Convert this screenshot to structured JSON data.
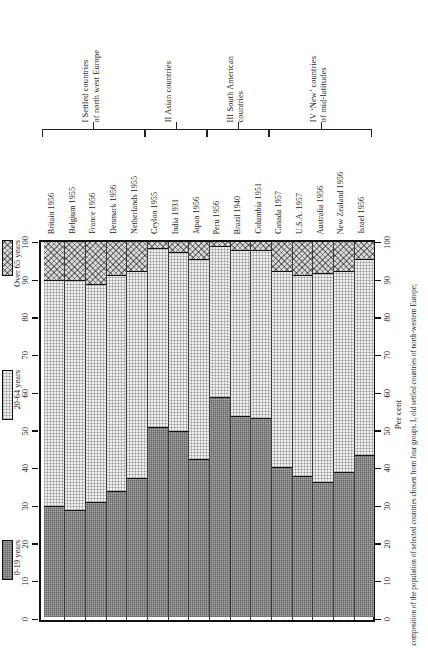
{
  "figure": {
    "caption": "Fig. 25.6  The age–composition of the population of selected countries chosen from four groups. I, old settled countries of north-western Europe;",
    "axis_title_right": "Per cent"
  },
  "legend": {
    "items": [
      {
        "key": "old",
        "label": "Over 65 years",
        "pattern": "cross-hatch"
      },
      {
        "key": "adult",
        "label": "20-64 years",
        "pattern": "fine-stipple"
      },
      {
        "key": "young",
        "label": "0-19 years",
        "pattern": "dark-stipple"
      }
    ]
  },
  "groups": [
    {
      "id": "I",
      "label": "I Settled countries\nof north west Europe",
      "line1": "I Settled countries",
      "line2": "of north west Europe",
      "count": 5
    },
    {
      "id": "II",
      "label": "II Asian countries",
      "line1": "II Asian countries",
      "line2": "",
      "count": 3
    },
    {
      "id": "III",
      "label": "III South American\ncountries",
      "line1": "III South American",
      "line2": "countries",
      "count": 3
    },
    {
      "id": "IV",
      "label": "IV 'New' countries\nof mid-latitudes",
      "line1": "IV ‘New’ countries",
      "line2": "of mid-latitudes",
      "count": 5
    }
  ],
  "axis": {
    "ticks": [
      0,
      10,
      20,
      30,
      40,
      50,
      60,
      70,
      80,
      90,
      100
    ],
    "tick_labels": [
      "0",
      "10",
      "20",
      "30",
      "40",
      "50",
      "60",
      "70",
      "80",
      "90",
      "100"
    ],
    "min": 0,
    "max": 100
  },
  "chart_data": {
    "type": "bar",
    "stacked": true,
    "title": "",
    "xlabel": "",
    "ylabel": "Per cent",
    "ylim": [
      0,
      100
    ],
    "grid": false,
    "legend_position": "left",
    "categories": [
      "Britain 1956",
      "Belgium 1955",
      "France 1956",
      "Denmark 1956",
      "Netherlands 1955",
      "Ceylon 1955",
      "India 1931",
      "Japan 1956",
      "Peru 1956",
      "Brazil 1940",
      "Columbia 1951",
      "Canada 1957",
      "U.S.A. 1957",
      "Australia 1956",
      "New Zealand 1956",
      "Israel 1956"
    ],
    "group_of_category": [
      "I",
      "I",
      "I",
      "I",
      "I",
      "II",
      "II",
      "II",
      "III",
      "III",
      "III",
      "IV",
      "IV",
      "IV",
      "IV"
    ],
    "series": [
      {
        "name": "0-19 years",
        "key": "young",
        "values": [
          29.5,
          28.5,
          30.5,
          33.5,
          37.0,
          50.5,
          49.5,
          42.0,
          58.5,
          53.5,
          53.0,
          40.0,
          37.5,
          36.0,
          38.5,
          43.0
        ]
      },
      {
        "name": "20-64 years",
        "key": "adult",
        "values": [
          60.0,
          61.0,
          58.0,
          57.5,
          55.0,
          47.5,
          47.5,
          53.0,
          40.0,
          44.0,
          44.5,
          52.0,
          53.5,
          55.5,
          53.5,
          52.0
        ]
      },
      {
        "name": "Over 65 years",
        "key": "old",
        "values": [
          10.5,
          10.5,
          11.5,
          9.0,
          8.0,
          2.0,
          3.0,
          5.0,
          1.5,
          2.5,
          2.5,
          8.0,
          9.0,
          8.5,
          8.0,
          5.0
        ]
      }
    ],
    "cumulative_tops": {
      "young": [
        29.5,
        28.5,
        30.5,
        33.5,
        37.0,
        50.5,
        49.5,
        42.0,
        58.5,
        53.5,
        53.0,
        40.0,
        37.5,
        36.0,
        38.5,
        43.0
      ],
      "adult": [
        89.5,
        89.5,
        88.5,
        91.0,
        92.0,
        98.0,
        97.0,
        95.0,
        98.5,
        97.5,
        97.5,
        92.0,
        91.0,
        91.5,
        92.0,
        95.0
      ]
    }
  }
}
